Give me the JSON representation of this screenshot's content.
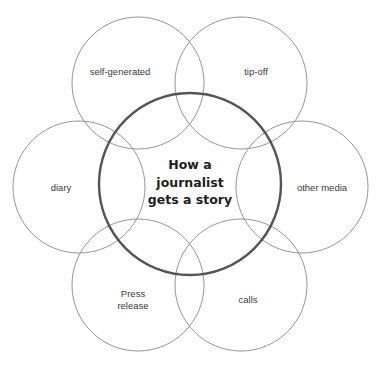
{
  "diagram": {
    "center": {
      "lines": [
        "How a",
        "journalist",
        "gets a story"
      ]
    },
    "sources": [
      {
        "id": "self-generated",
        "label": "self-generated"
      },
      {
        "id": "tip-off",
        "label": "tip-off"
      },
      {
        "id": "diary",
        "label": "diary"
      },
      {
        "id": "other-media",
        "label": "other media"
      },
      {
        "id": "press-release",
        "lines": [
          "Press",
          "release"
        ]
      },
      {
        "id": "calls",
        "label": "calls"
      }
    ]
  }
}
